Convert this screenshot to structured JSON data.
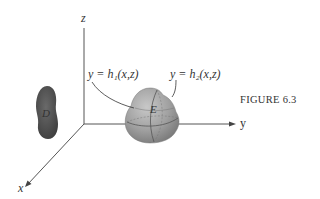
{
  "figure": {
    "caption": "FIGURE 6.3",
    "axes": {
      "x_label": "x",
      "y_label": "y",
      "z_label": "z"
    },
    "region_label": "D",
    "solid_label": "E",
    "surface_labels": {
      "left": "y = h₁(x,z)",
      "right": "y = h₂(x,z)"
    },
    "colors": {
      "region_D": "#4a4a4a",
      "solid_E": "#9a9a9a",
      "axes": "#444444"
    }
  }
}
